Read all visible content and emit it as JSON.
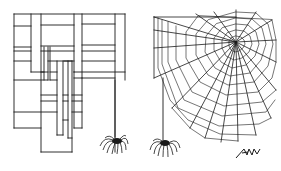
{
  "illustration": {
    "description": "Cartoon: a rectilinear grid-shaped web with a hanging spider beside a traditional radial spider web with a hanging spider",
    "left_panel": {
      "label": "grid-web",
      "subject": "rectangular maze-like web with spider"
    },
    "right_panel": {
      "label": "radial-web",
      "subject": "classic orb spider web with spider"
    },
    "signature": "AKW",
    "colors": {
      "ink": "#1a1a1a",
      "background": "#ffffff"
    }
  }
}
